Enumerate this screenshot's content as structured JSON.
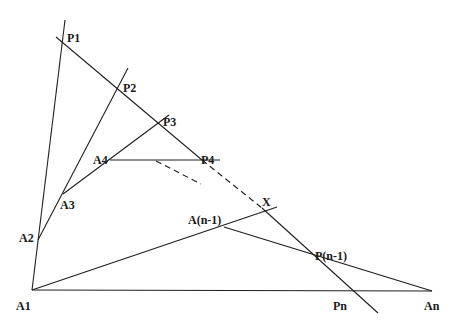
{
  "diagram": {
    "stroke_color": "#1f1f1f",
    "background": "#ffffff",
    "points": {
      "A1": {
        "label": "A1",
        "x": 32,
        "y": 290
      },
      "A2": {
        "label": "A2",
        "x": 38,
        "y": 240
      },
      "A3": {
        "label": "A3",
        "x": 63,
        "y": 194
      },
      "A4": {
        "label": "A4",
        "x": 110,
        "y": 160
      },
      "An_1": {
        "label": "A(n-1)",
        "x": 224,
        "y": 227
      },
      "An": {
        "label": "An",
        "x": 432,
        "y": 291
      },
      "P1": {
        "label": "P1",
        "x": 62,
        "y": 39
      },
      "P2": {
        "label": "P2",
        "x": 118,
        "y": 88
      },
      "P3": {
        "label": "P3",
        "x": 161,
        "y": 122
      },
      "P4": {
        "label": "P4",
        "x": 202,
        "y": 160
      },
      "Pn_1": {
        "label": "P(n-1)",
        "x": 312,
        "y": 255
      },
      "Pn": {
        "label": "Pn",
        "x": 355,
        "y": 291
      },
      "X": {
        "label": "X",
        "x": 263,
        "y": 210
      }
    },
    "segments": [
      {
        "from": [
          32,
          290
        ],
        "to": [
          65,
          20
        ],
        "style": "solid",
        "name": "line-A1-P1"
      },
      {
        "from": [
          38,
          240
        ],
        "to": [
          128,
          68
        ],
        "style": "solid",
        "name": "line-A2-P2"
      },
      {
        "from": [
          63,
          194
        ],
        "to": [
          169,
          115
        ],
        "style": "solid",
        "name": "line-A3-P3"
      },
      {
        "from": [
          110,
          160
        ],
        "to": [
          220,
          160
        ],
        "style": "solid",
        "name": "line-A4-P4"
      },
      {
        "from": [
          56,
          37
        ],
        "to": [
          202,
          160
        ],
        "style": "solid",
        "name": "transversal-upper"
      },
      {
        "from": [
          202,
          160
        ],
        "to": [
          262,
          208
        ],
        "style": "dashed",
        "name": "transversal-dashed"
      },
      {
        "from": [
          262,
          208
        ],
        "to": [
          378,
          313
        ],
        "style": "solid",
        "name": "transversal-lower"
      },
      {
        "from": [
          156,
          161
        ],
        "to": [
          201,
          184
        ],
        "style": "dashed",
        "name": "dashed-continuation"
      },
      {
        "from": [
          32,
          290
        ],
        "to": [
          277,
          207
        ],
        "style": "solid",
        "name": "line-A1-X"
      },
      {
        "from": [
          224,
          227
        ],
        "to": [
          432,
          291
        ],
        "style": "solid",
        "name": "line-An1-An"
      },
      {
        "from": [
          32,
          290
        ],
        "to": [
          432,
          291
        ],
        "style": "solid",
        "name": "line-A1-An"
      }
    ],
    "labels": [
      {
        "text": "P1",
        "x": 67,
        "y": 42
      },
      {
        "text": "P2",
        "x": 123,
        "y": 92
      },
      {
        "text": "P3",
        "x": 163,
        "y": 126
      },
      {
        "text": "A4",
        "x": 93,
        "y": 164
      },
      {
        "text": "P4",
        "x": 201,
        "y": 164
      },
      {
        "text": "A3",
        "x": 60,
        "y": 209
      },
      {
        "text": "X",
        "x": 262,
        "y": 206
      },
      {
        "text": "A(n-1)",
        "x": 188,
        "y": 224
      },
      {
        "text": "A2",
        "x": 19,
        "y": 242
      },
      {
        "text": "P(n-1)",
        "x": 315,
        "y": 260
      },
      {
        "text": "A1",
        "x": 16,
        "y": 310
      },
      {
        "text": "Pn",
        "x": 333,
        "y": 310
      },
      {
        "text": "An",
        "x": 424,
        "y": 310
      }
    ]
  }
}
